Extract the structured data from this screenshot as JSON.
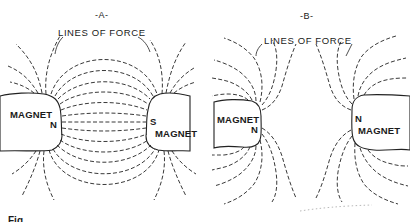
{
  "figure": {
    "panels": [
      {
        "id": "A",
        "title": "-A-",
        "lines_label": "LINES OF FORCE",
        "description": "Unlike poles: field lines run from N to S magnet",
        "left_magnet": {
          "label": "MAGNET",
          "pole": "N"
        },
        "right_magnet": {
          "label": "MAGNET",
          "pole": "S"
        }
      },
      {
        "id": "B",
        "title": "-B-",
        "lines_label": "LINES OF FORCE",
        "description": "Like poles: field lines repel and bend away",
        "left_magnet": {
          "label": "MAGNET",
          "pole": "N"
        },
        "right_magnet": {
          "label": "MAGNET",
          "pole": "N"
        }
      }
    ],
    "caption_partial": "Fig."
  }
}
